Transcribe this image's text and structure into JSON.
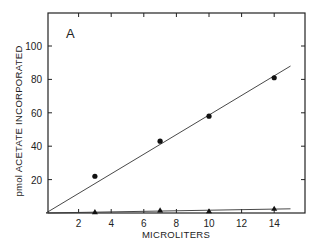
{
  "chart_data": {
    "type": "scatter",
    "title": "",
    "panel_label": "A",
    "xlabel": "MICROLITERS",
    "ylabel": "pmol ACETATE INCORPORATED",
    "xlim": [
      0,
      16
    ],
    "ylim": [
      0,
      120
    ],
    "x_ticks": [
      2,
      4,
      6,
      8,
      10,
      12,
      14
    ],
    "y_ticks": [
      20,
      40,
      60,
      80,
      100
    ],
    "y_tick_labels": [
      "20",
      "40",
      "60",
      "80",
      "100"
    ],
    "grid": false,
    "legend": null,
    "series": [
      {
        "name": "circles",
        "marker": "circle",
        "x": [
          3,
          7,
          10,
          14
        ],
        "y": [
          22,
          43,
          58,
          81
        ],
        "fit_line": {
          "x": [
            0,
            15
          ],
          "y": [
            0,
            88
          ]
        }
      },
      {
        "name": "triangles",
        "marker": "triangle",
        "x": [
          3,
          7,
          10,
          14
        ],
        "y": [
          0.5,
          1.5,
          1,
          2.5
        ],
        "fit_line": {
          "x": [
            0,
            15
          ],
          "y": [
            0,
            2.5
          ]
        }
      }
    ]
  }
}
